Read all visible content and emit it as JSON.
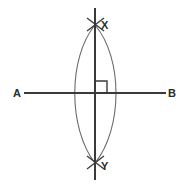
{
  "figure": {
    "background_color": "#ffffff",
    "line_color": "#3a3a3a",
    "arc_color": "#6b6b6b",
    "label_color": "#2b2b2b",
    "width": 186,
    "height": 187
  },
  "labels": {
    "a": "A",
    "b": "B",
    "x": "X",
    "y": "Y"
  },
  "geometry": {
    "line_ab": {
      "name": "AB",
      "x1": 24,
      "y1": 93,
      "x2": 166,
      "y2": 93
    },
    "line_xy": {
      "name": "XY",
      "x1": 95,
      "y1": 8,
      "x2": 95,
      "y2": 180
    },
    "intersection": {
      "x": 95,
      "y": 93
    },
    "arc_left": {
      "center_x": 122,
      "apex_x": 68,
      "top_y": 25,
      "bottom_y": 163
    },
    "arc_right": {
      "center_x": 68,
      "apex_x": 123,
      "top_y": 25,
      "bottom_y": 163
    },
    "right_angle_marker": {
      "x": 96,
      "y": 81,
      "size": 11
    },
    "cross_mark_x": {
      "cx": 95,
      "cy": 25,
      "arm": 9
    },
    "cross_mark_y": {
      "cx": 95,
      "cy": 163,
      "arm": 9
    }
  },
  "label_positions": {
    "a": {
      "x": 13,
      "y": 97
    },
    "b": {
      "x": 168,
      "y": 97
    },
    "x": {
      "x": 101,
      "y": 29
    },
    "y": {
      "x": 101,
      "y": 170
    }
  }
}
